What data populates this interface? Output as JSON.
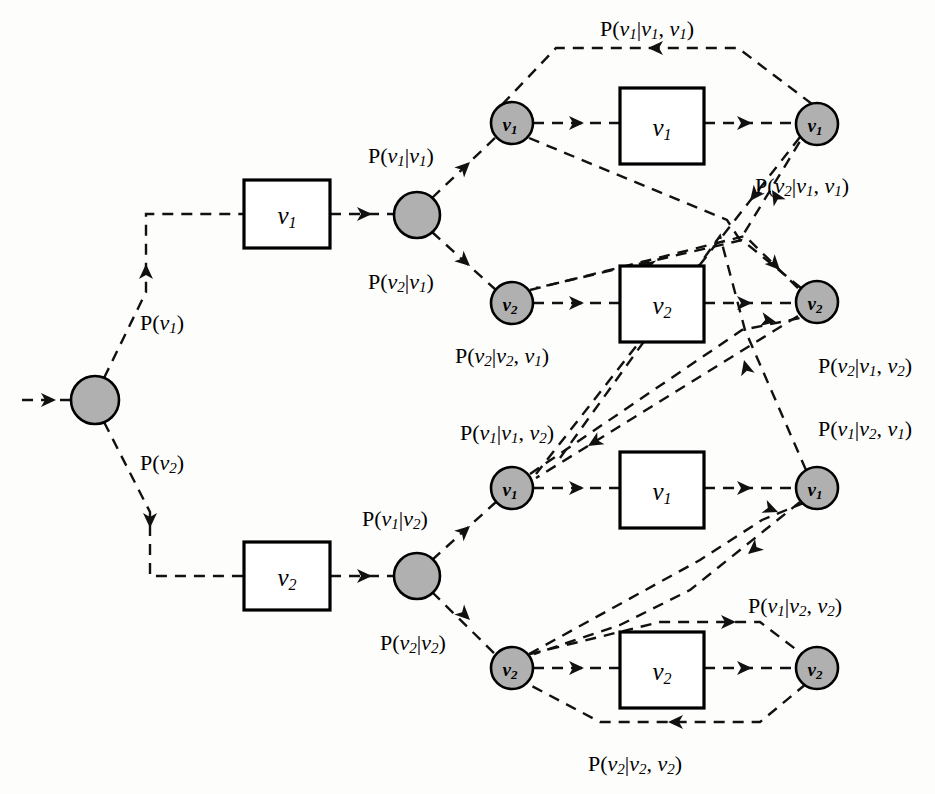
{
  "diagram": {
    "type": "state-transition-trellis",
    "colors": {
      "node_fill": "#b0b0b0",
      "node_stroke": "#000000",
      "box_fill": "#ffffff",
      "box_stroke": "#000000",
      "edge_stroke": "#111111",
      "background": "#fdfdfc"
    },
    "symbols": {
      "v1": "v",
      "v1_sub": "1",
      "v2": "v",
      "v2_sub": "2"
    },
    "nodes": [
      {
        "id": "root",
        "label": "",
        "sub": "",
        "cx": 95,
        "cy": 400,
        "r": 24
      },
      {
        "id": "b1",
        "label": "",
        "sub": "",
        "cx": 417,
        "cy": 215,
        "r": 23
      },
      {
        "id": "b2",
        "label": "",
        "sub": "",
        "cx": 417,
        "cy": 576,
        "r": 23
      },
      {
        "id": "s11",
        "label": "v",
        "sub": "1",
        "cx": 512,
        "cy": 123,
        "r": 21
      },
      {
        "id": "s12",
        "label": "v",
        "sub": "2",
        "cx": 512,
        "cy": 303,
        "r": 21
      },
      {
        "id": "s21",
        "label": "v",
        "sub": "1",
        "cx": 512,
        "cy": 488,
        "r": 21
      },
      {
        "id": "s22",
        "label": "v",
        "sub": "2",
        "cx": 512,
        "cy": 668,
        "r": 21
      },
      {
        "id": "o11",
        "label": "v",
        "sub": "1",
        "cx": 817,
        "cy": 124,
        "r": 21
      },
      {
        "id": "o12",
        "label": "v",
        "sub": "2",
        "cx": 817,
        "cy": 302,
        "r": 21
      },
      {
        "id": "o21",
        "label": "v",
        "sub": "1",
        "cx": 817,
        "cy": 488,
        "r": 21
      },
      {
        "id": "o22",
        "label": "v",
        "sub": "2",
        "cx": 817,
        "cy": 668,
        "r": 21
      }
    ],
    "boxes": [
      {
        "id": "box-l1",
        "label": "v",
        "sub": "1",
        "x": 244,
        "y": 180,
        "w": 86,
        "h": 68
      },
      {
        "id": "box-l2",
        "label": "v",
        "sub": "2",
        "x": 244,
        "y": 542,
        "w": 86,
        "h": 68
      },
      {
        "id": "box-r1",
        "label": "v",
        "sub": "1",
        "x": 620,
        "y": 88,
        "w": 84,
        "h": 76
      },
      {
        "id": "box-r2",
        "label": "v",
        "sub": "2",
        "x": 620,
        "y": 266,
        "w": 84,
        "h": 76
      },
      {
        "id": "box-r3",
        "label": "v",
        "sub": "1",
        "x": 620,
        "y": 452,
        "w": 84,
        "h": 76
      },
      {
        "id": "box-r4",
        "label": "v",
        "sub": "2",
        "x": 620,
        "y": 632,
        "w": 84,
        "h": 76
      }
    ],
    "labels": [
      {
        "id": "p-v1",
        "text": "P(v1)",
        "parts": [
          "P(",
          "v",
          "1",
          ")"
        ],
        "x": 140,
        "y": 322,
        "anchor": "start"
      },
      {
        "id": "p-v2",
        "text": "P(v2)",
        "parts": [
          "P(",
          "v",
          "2",
          ")"
        ],
        "x": 140,
        "y": 462,
        "anchor": "start"
      },
      {
        "id": "p-v1-v1",
        "text": "P(v1|v1)",
        "parts": [
          "P(",
          "v",
          "1",
          "|",
          "v",
          "1",
          ")"
        ],
        "x": 368,
        "y": 155,
        "anchor": "start"
      },
      {
        "id": "p-v2-v1",
        "text": "P(v2|v1)",
        "parts": [
          "P(",
          "v",
          "2",
          "|",
          "v",
          "1",
          ")"
        ],
        "x": 368,
        "y": 281,
        "anchor": "start"
      },
      {
        "id": "p-v1-v2",
        "text": "P(v1|v2)",
        "parts": [
          "P(",
          "v",
          "1",
          "|",
          "v",
          "2",
          ")"
        ],
        "x": 362,
        "y": 518,
        "anchor": "start"
      },
      {
        "id": "p-v2-v2",
        "text": "P(v2|v2)",
        "parts": [
          "P(",
          "v",
          "2",
          "|",
          "v",
          "2",
          ")"
        ],
        "x": 380,
        "y": 642,
        "anchor": "start"
      },
      {
        "id": "p-v1-v1v1",
        "text": "P(v1|v1, v1)",
        "parts": [
          "P(",
          "v",
          "1",
          "|",
          "v",
          "1",
          ", ",
          "v",
          "1",
          ")"
        ],
        "x": 600,
        "y": 28,
        "anchor": "start"
      },
      {
        "id": "p-v2-v1v1",
        "text": "P(v2|v1, v1)",
        "parts": [
          "P(",
          "v",
          "2",
          "|",
          "v",
          "1",
          ", ",
          "v",
          "1",
          ")"
        ],
        "x": 755,
        "y": 185,
        "anchor": "start"
      },
      {
        "id": "p-v2-v2v1",
        "text": "P(v2|v2, v1)",
        "parts": [
          "P(",
          "v",
          "2",
          "|",
          "v",
          "2",
          ", ",
          "v",
          "1",
          ")"
        ],
        "x": 455,
        "y": 355,
        "anchor": "start"
      },
      {
        "id": "p-v2-v1v2",
        "text": "P(v2|v1, v2)",
        "parts": [
          "P(",
          "v",
          "2",
          "|",
          "v",
          "1",
          ", ",
          "v",
          "2",
          ")"
        ],
        "x": 818,
        "y": 365,
        "anchor": "start"
      },
      {
        "id": "p-v1-v1v2",
        "text": "P(v1|v1, v2)",
        "parts": [
          "P(",
          "v",
          "1",
          "|",
          "v",
          "1",
          ", ",
          "v",
          "2",
          ")"
        ],
        "x": 460,
        "y": 432,
        "anchor": "start"
      },
      {
        "id": "p-v1-v2v1",
        "text": "P(v1|v2, v1)",
        "parts": [
          "P(",
          "v",
          "1",
          "|",
          "v",
          "2",
          ", ",
          "v",
          "1",
          ")"
        ],
        "x": 818,
        "y": 428,
        "anchor": "start"
      },
      {
        "id": "p-v1-v2v2",
        "text": "P(v1|v2, v2)",
        "parts": [
          "P(",
          "v",
          "1",
          "|",
          "v",
          "2",
          ", ",
          "v",
          "2",
          ")"
        ],
        "x": 748,
        "y": 605,
        "anchor": "start"
      },
      {
        "id": "p-v2-v2v2",
        "text": "P(v2|v2, v2)",
        "parts": [
          "P(",
          "v",
          "2",
          "|",
          "v",
          "2",
          ", ",
          "v",
          "2",
          ")"
        ],
        "x": 588,
        "y": 763,
        "anchor": "start"
      }
    ],
    "edges": [
      {
        "id": "edge-in-root",
        "from": "input",
        "to": "root",
        "d": "M 22,400 L 71,400",
        "arrows": [
          {
            "x": 56,
            "y": 400,
            "angle": 0
          }
        ]
      },
      {
        "id": "edge-root-up",
        "from": "root",
        "to": "box-l1",
        "d": "M 104,378 L 146,292 L 146,214 L 244,214",
        "arrows": [
          {
            "x": 146,
            "y": 264,
            "angle": -90
          }
        ]
      },
      {
        "id": "edge-root-down",
        "from": "root",
        "to": "box-l2",
        "d": "M 104,422 L 150,512 L 150,576 L 244,576",
        "arrows": [
          {
            "x": 150,
            "y": 528,
            "angle": 90
          }
        ]
      },
      {
        "id": "edge-boxl1-b1",
        "from": "box-l1",
        "to": "b1",
        "d": "M 330,214 L 394,214",
        "arrows": [
          {
            "x": 372,
            "y": 214,
            "angle": 0
          }
        ]
      },
      {
        "id": "edge-boxl2-b2",
        "from": "box-l2",
        "to": "b2",
        "d": "M 330,576 L 394,576",
        "arrows": [
          {
            "x": 372,
            "y": 576,
            "angle": 0
          }
        ]
      },
      {
        "id": "edge-b1-s11",
        "from": "b1",
        "to": "s11",
        "d": "M 432,198 L 496,137",
        "arrows": [
          {
            "x": 470,
            "y": 162,
            "angle": -44
          }
        ]
      },
      {
        "id": "edge-b1-s12",
        "from": "b1",
        "to": "s12",
        "d": "M 432,232 L 496,290",
        "arrows": [
          {
            "x": 470,
            "y": 266,
            "angle": 42
          }
        ]
      },
      {
        "id": "edge-b2-s21",
        "from": "b2",
        "to": "s21",
        "d": "M 432,560 L 496,502",
        "arrows": [
          {
            "x": 470,
            "y": 526,
            "angle": -42
          }
        ]
      },
      {
        "id": "edge-b2-s22",
        "from": "b2",
        "to": "s22",
        "d": "M 432,592 L 496,655",
        "arrows": [
          {
            "x": 470,
            "y": 620,
            "angle": 44
          }
        ]
      },
      {
        "id": "edge-s11-box",
        "from": "s11",
        "to": "box-r1",
        "d": "M 533,123 L 620,123",
        "arrows": [
          {
            "x": 584,
            "y": 123,
            "angle": 0
          }
        ]
      },
      {
        "id": "edge-s12-box",
        "from": "s12",
        "to": "box-r2",
        "d": "M 533,303 L 620,303",
        "arrows": [
          {
            "x": 584,
            "y": 303,
            "angle": 0
          }
        ]
      },
      {
        "id": "edge-s21-box",
        "from": "s21",
        "to": "box-r3",
        "d": "M 533,488 L 620,488",
        "arrows": [
          {
            "x": 584,
            "y": 488,
            "angle": 0
          }
        ]
      },
      {
        "id": "edge-s22-box",
        "from": "s22",
        "to": "box-r4",
        "d": "M 533,668 L 620,668",
        "arrows": [
          {
            "x": 584,
            "y": 668,
            "angle": 0
          }
        ]
      },
      {
        "id": "edge-box-o11",
        "from": "box-r1",
        "to": "o11",
        "d": "M 704,123 L 796,123",
        "arrows": [
          {
            "x": 752,
            "y": 123,
            "angle": 0
          }
        ]
      },
      {
        "id": "edge-box-o12",
        "from": "box-r2",
        "to": "o12",
        "d": "M 704,303 L 796,303",
        "arrows": [
          {
            "x": 752,
            "y": 303,
            "angle": 0
          }
        ]
      },
      {
        "id": "edge-box-o21",
        "from": "box-r3",
        "to": "o21",
        "d": "M 704,488 L 796,488",
        "arrows": [
          {
            "x": 752,
            "y": 488,
            "angle": 0
          }
        ]
      },
      {
        "id": "edge-box-o22",
        "from": "box-r4",
        "to": "o22",
        "d": "M 704,668 L 796,668",
        "arrows": [
          {
            "x": 752,
            "y": 668,
            "angle": 0
          }
        ]
      },
      {
        "id": "edge-fb-11-11",
        "from": "o11",
        "to": "s11",
        "d": "M 812,104 L 738,48 L 556,48 L 497,110",
        "arrows": [
          {
            "x": 648,
            "y": 48,
            "angle": 180
          }
        ]
      },
      {
        "id": "edge-fb-11-21",
        "from": "o11",
        "to": "s21",
        "d": "M 800,137 L 536,474",
        "arrows": [
          {
            "x": 750,
            "y": 201,
            "angle": 128
          }
        ]
      },
      {
        "id": "edge-cross-11-up",
        "from": "s11",
        "to": "o11",
        "d": "M 529,138 L 727,220 L 740,240 L 802,138",
        "arrows": [
          {
            "x": 772,
            "y": 190,
            "angle": -121
          }
        ]
      },
      {
        "id": "edge-fb-12-12",
        "from": "o12",
        "to": "s12",
        "d": "M 801,288 L 742,240 L 536,288",
        "arrows": [
          {
            "x": 640,
            "y": 264,
            "angle": 193
          }
        ]
      },
      {
        "id": "edge-cross-12-o",
        "from": "s12",
        "to": "o12",
        "d": "M 530,290 L 745,236 L 800,290",
        "arrows": [
          {
            "x": 780,
            "y": 270,
            "angle": 46
          }
        ]
      },
      {
        "id": "edge-fb-12-21",
        "from": "o12",
        "to": "s21",
        "d": "M 798,316 L 536,478",
        "arrows": [
          {
            "x": 588,
            "y": 446,
            "angle": 149
          }
        ]
      },
      {
        "id": "edge-cross-21-12",
        "from": "s21",
        "to": "o12",
        "d": "M 530,474 L 742,330 L 800,318",
        "arrows": [
          {
            "x": 776,
            "y": 322,
            "angle": 11
          }
        ]
      },
      {
        "id": "edge-fb-21-21",
        "from": "o21",
        "to": "s21",
        "d": "M 806,470 L 745,330 L 720,236 L 560,458",
        "arrows": [
          {
            "x": 744,
            "y": 360,
            "angle": 255
          }
        ]
      },
      {
        "id": "edge-22-o21",
        "from": "s22",
        "to": "o21",
        "d": "M 529,654 L 700,560 L 762,520 L 806,502",
        "arrows": [
          {
            "x": 778,
            "y": 512,
            "angle": 22
          }
        ]
      },
      {
        "id": "edge-fb-22-o22",
        "from": "s22",
        "to": "o22",
        "d": "M 530,654 L 660,622 L 760,622 L 802,654",
        "arrows": [
          {
            "x": 736,
            "y": 622,
            "angle": 0
          }
        ]
      },
      {
        "id": "edge-fb-o22-22",
        "from": "o22",
        "to": "s22",
        "d": "M 806,684 L 760,722 L 600,722 L 528,684",
        "arrows": [
          {
            "x": 668,
            "y": 722,
            "angle": 180
          }
        ]
      },
      {
        "id": "edge-o21-22",
        "from": "o21",
        "to": "s22",
        "d": "M 800,502 L 690,590 L 620,625 L 534,654",
        "arrows": [
          {
            "x": 748,
            "y": 554,
            "angle": 140
          }
        ]
      }
    ]
  }
}
